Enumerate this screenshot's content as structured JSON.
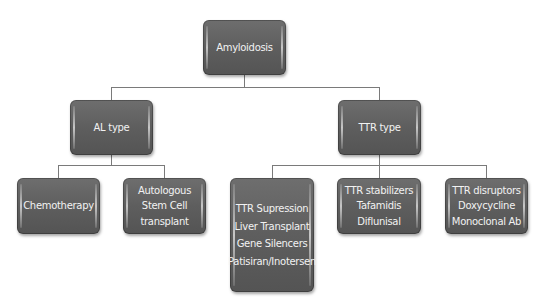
{
  "diagram": {
    "type": "tree",
    "root": {
      "label": "Amyloidosis"
    },
    "branches": [
      {
        "label": "AL type",
        "children": [
          {
            "lines": [
              "Chemotherapy"
            ]
          },
          {
            "lines": [
              "Autologous",
              "Stem Cell",
              "transplant"
            ]
          }
        ]
      },
      {
        "label": "TTR type",
        "children": [
          {
            "lines": [
              "TTR Supression",
              "Liver Transplant",
              "Gene Silencers",
              "Patisiran/Inotersen"
            ]
          },
          {
            "lines": [
              "TTR stabilizers",
              "Tafamidis",
              "Diflunisal"
            ]
          },
          {
            "lines": [
              "TTR disruptors",
              "Doxycycline",
              "Monoclonal Ab"
            ]
          }
        ]
      }
    ],
    "colors": {
      "node_fill": "#5e5e5e",
      "node_text": "#f2f2f2",
      "connector": "#7a7a7a",
      "background": "#ffffff"
    }
  }
}
